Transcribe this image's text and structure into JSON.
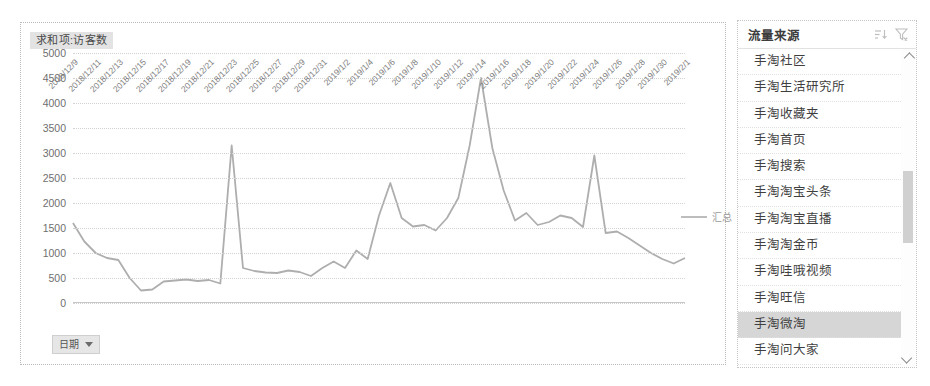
{
  "chart": {
    "title": "求和项:访客数",
    "legend_label": "汇总",
    "date_button_label": "日期",
    "caret_icon": "caret-down-icon"
  },
  "slicer": {
    "title": "流量来源",
    "sort_icon": "sort-icon",
    "filter_icon": "funnel-filter-icon",
    "scroll_up_icon": "chevron-up-icon",
    "scroll_down_icon": "chevron-down-icon",
    "selected": "手淘微淘",
    "items": [
      {
        "label": "手淘社区",
        "selected": false
      },
      {
        "label": "手淘生活研究所",
        "selected": false
      },
      {
        "label": "手淘收藏夹",
        "selected": false
      },
      {
        "label": "手淘首页",
        "selected": false
      },
      {
        "label": "手淘搜索",
        "selected": false
      },
      {
        "label": "手淘淘宝头条",
        "selected": false
      },
      {
        "label": "手淘淘宝直播",
        "selected": false
      },
      {
        "label": "手淘淘金币",
        "selected": false
      },
      {
        "label": "手淘哇哦视频",
        "selected": false
      },
      {
        "label": "手淘旺信",
        "selected": false
      },
      {
        "label": "手淘微淘",
        "selected": true
      },
      {
        "label": "手淘问大家",
        "selected": false
      },
      {
        "label": "手淘我的评价",
        "selected": false
      }
    ]
  },
  "chart_data": {
    "type": "line",
    "title": "求和项:访客数",
    "xlabel": "",
    "ylabel": "",
    "ylim": [
      0,
      5000
    ],
    "yticks": [
      0,
      500,
      1000,
      1500,
      2000,
      2500,
      3000,
      3500,
      4000,
      4500,
      5000
    ],
    "grid": true,
    "legend_position": "right",
    "series": [
      {
        "name": "汇总",
        "color": "#aeaeae",
        "x": [
          "2018/12/9",
          "2018/12/10",
          "2018/12/11",
          "2018/12/12",
          "2018/12/13",
          "2018/12/14",
          "2018/12/15",
          "2018/12/16",
          "2018/12/17",
          "2018/12/18",
          "2018/12/19",
          "2018/12/20",
          "2018/12/21",
          "2018/12/22",
          "2018/12/23",
          "2018/12/24",
          "2018/12/25",
          "2018/12/26",
          "2018/12/27",
          "2018/12/28",
          "2018/12/29",
          "2018/12/30",
          "2018/12/31",
          "2019/1/1",
          "2019/1/2",
          "2019/1/3",
          "2019/1/4",
          "2019/1/5",
          "2019/1/6",
          "2019/1/7",
          "2019/1/8",
          "2019/1/9",
          "2019/1/10",
          "2019/1/11",
          "2019/1/12",
          "2019/1/13",
          "2019/1/14",
          "2019/1/15",
          "2019/1/16",
          "2019/1/17",
          "2019/1/18",
          "2019/1/19",
          "2019/1/20",
          "2019/1/21",
          "2019/1/22",
          "2019/1/23",
          "2019/1/24",
          "2019/1/25",
          "2019/1/26",
          "2019/1/27",
          "2019/1/28",
          "2019/1/29",
          "2019/1/30",
          "2019/1/31",
          "2019/2/1"
        ],
        "values": [
          1600,
          1230,
          1000,
          900,
          860,
          500,
          250,
          270,
          430,
          450,
          470,
          440,
          460,
          390,
          3150,
          700,
          640,
          610,
          600,
          650,
          620,
          540,
          700,
          830,
          700,
          1050,
          880,
          1750,
          2400,
          1700,
          1530,
          1560,
          1450,
          1700,
          2100,
          3150,
          4500,
          3100,
          2250,
          1650,
          1800,
          1560,
          1620,
          1750,
          1700,
          1520,
          2950,
          1400,
          1430,
          1300,
          1150,
          1000,
          880,
          790,
          900
        ]
      }
    ],
    "xtick_labels": [
      "2018/12/9",
      "2018/12/11",
      "2018/12/13",
      "2018/12/15",
      "2018/12/17",
      "2018/12/19",
      "2018/12/21",
      "2018/12/23",
      "2018/12/25",
      "2018/12/27",
      "2018/12/29",
      "2018/12/31",
      "2019/1/2",
      "2019/1/4",
      "2019/1/6",
      "2019/1/8",
      "2019/1/10",
      "2019/1/12",
      "2019/1/14",
      "2019/1/16",
      "2019/1/18",
      "2019/1/20",
      "2019/1/22",
      "2019/1/24",
      "2019/1/26",
      "2019/1/28",
      "2019/1/30",
      "2019/2/1"
    ]
  }
}
